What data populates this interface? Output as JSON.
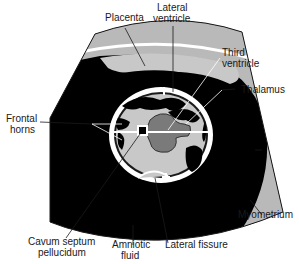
{
  "diagram": {
    "type": "ultrasound-schematic",
    "colors": {
      "amniotic_fluid": "#000000",
      "tissue_light": "#c8c8c8",
      "myometrium": "#b9b9b9",
      "placenta": "#bdbdbd",
      "thalamus": "#7a7a7a",
      "skull": "#ffffff",
      "outline": "#1a1a1a"
    },
    "labels": {
      "placenta": "Placenta",
      "lateral_ventricle_1": "Lateral",
      "lateral_ventricle_2": "ventricle",
      "third_ventricle_1": "Third",
      "third_ventricle_2": "ventricle",
      "thalamus": "Thalamus",
      "frontal_horns_1": "Frontal",
      "frontal_horns_2": "horns",
      "myometrium": "Myometrium",
      "cavum_1": "Cavum septum",
      "cavum_2": "pellucidum",
      "amniotic_1": "Amniotic",
      "amniotic_2": "fluid",
      "lateral_fissure": "Lateral fissure"
    },
    "markers": [
      "caliper-top",
      "caliper-bottom"
    ]
  }
}
